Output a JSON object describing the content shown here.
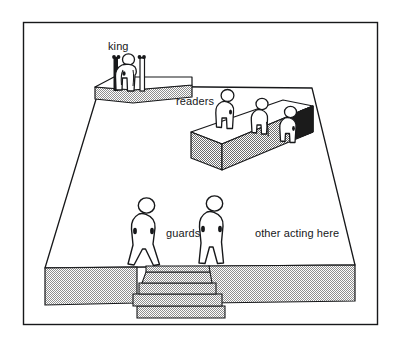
{
  "figure": {
    "background_color": "#ffffff",
    "ink_color": "#17181a",
    "hatch_color": "#8a8a8a",
    "dark_face_color": "#1b1b1b"
  },
  "frame": {
    "name": "outer-border",
    "stroke": "#17181a",
    "x": 23,
    "y": 22,
    "width": 355,
    "height": 303
  },
  "labels": [
    {
      "id": "king",
      "text": "king",
      "x": 108,
      "y": 41
    },
    {
      "id": "readers",
      "text": "readers",
      "x": 176,
      "y": 96
    },
    {
      "id": "guards",
      "text": "guards",
      "x": 166,
      "y": 228
    },
    {
      "id": "other",
      "text": "other acting here",
      "x": 255,
      "y": 228
    }
  ],
  "regions": {
    "stage_floor": {
      "name": "stage-floor",
      "shape": "trapezoid",
      "outline_points": "100,86 312,88 355,265 45,268"
    },
    "king_platform": {
      "name": "king-platform",
      "top_face": "95,87 152,83 192,85 133,90",
      "front_face_fill": "hatched",
      "height_px": 12
    },
    "readers_bench": {
      "name": "readers-bench",
      "top_face": "191,132 283,100 313,106 222,144",
      "front_face_fill": "hatched",
      "end_face_fill": "solid-dark",
      "height_px": 26
    },
    "front_apron": {
      "name": "front-apron",
      "fill": "hatched",
      "height_px": 38
    },
    "staircase": {
      "name": "staircase",
      "step_count": 4,
      "fill": "hatched"
    }
  },
  "figures": {
    "king": {
      "name": "king-figure",
      "count": 1,
      "pose": "seated on throne",
      "throne": {
        "posts": 2,
        "finials": 4
      }
    },
    "readers": {
      "name": "reader-figure",
      "count": 3,
      "pose": "standing on bench"
    },
    "guards": {
      "name": "guard-figure",
      "count": 2,
      "pose": "standing, legs apart"
    }
  }
}
